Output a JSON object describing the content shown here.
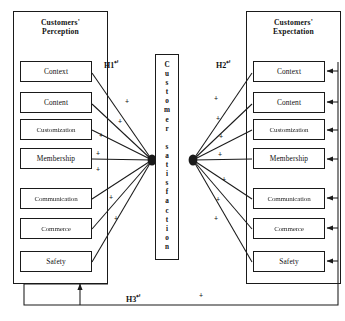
{
  "diagram": {
    "left_container": {
      "name": "customers-perception",
      "title_line1": "Customers'",
      "title_line2": "Perception",
      "nodes": [
        {
          "id": "context",
          "label": "Context"
        },
        {
          "id": "content",
          "label": "Content"
        },
        {
          "id": "customization",
          "label": "Customization"
        },
        {
          "id": "membership",
          "label": "Membership"
        },
        {
          "id": "communication",
          "label": "Communication"
        },
        {
          "id": "commerce",
          "label": "Commerce"
        },
        {
          "id": "safety",
          "label": "Safety"
        }
      ]
    },
    "right_container": {
      "name": "customers-expectation",
      "title_line1": "Customers'",
      "title_line2": "Expectation",
      "nodes": [
        {
          "id": "context",
          "label": "Context"
        },
        {
          "id": "content",
          "label": "Content"
        },
        {
          "id": "customization",
          "label": "Customization"
        },
        {
          "id": "membership",
          "label": "Membership"
        },
        {
          "id": "communication",
          "label": "Communication"
        },
        {
          "id": "commerce",
          "label": "Commerce"
        },
        {
          "id": "safety",
          "label": "Safety"
        }
      ]
    },
    "center": {
      "label": "Customer satisfaction"
    },
    "hypotheses": {
      "h1": "H1",
      "h2": "H2",
      "h3": "H3"
    },
    "path_signs": {
      "sign": "+",
      "left_count": 7,
      "right_count": 7,
      "h3_sign": "+"
    },
    "colors": {
      "stroke": "#1a1a1a",
      "text": "#111111",
      "background": "#ffffff"
    }
  }
}
